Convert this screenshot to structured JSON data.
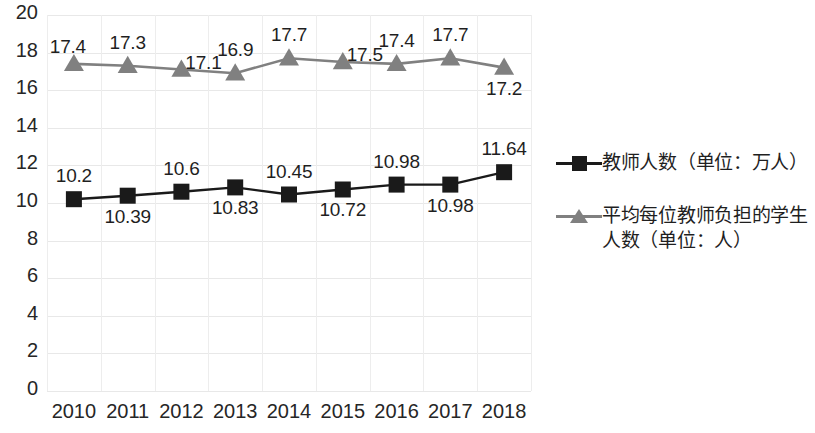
{
  "chart_data": {
    "type": "line",
    "title": "",
    "subtitle": "",
    "xlabel": "",
    "ylabel": "",
    "ylim": [
      0,
      20
    ],
    "y_ticks": [
      "0",
      "2",
      "4",
      "6",
      "8",
      "10",
      "12",
      "14",
      "16",
      "18",
      "20"
    ],
    "grid": true,
    "legend_position": "right",
    "categories": [
      "2010",
      "2011",
      "2012",
      "2013",
      "2014",
      "2015",
      "2016",
      "2017",
      "2018"
    ],
    "series": [
      {
        "name": "教师人数（单位：万人）",
        "marker": "square",
        "color": "#1a1a1a",
        "line_color": "#1a1a1a",
        "values": [
          10.2,
          10.39,
          10.6,
          10.83,
          10.45,
          10.72,
          10.98,
          10.98,
          11.64
        ],
        "labels": [
          "10.2",
          "10.39",
          "10.6",
          "10.83",
          "10.45",
          "10.72",
          "10.98",
          "10.98",
          "11.64"
        ],
        "label_positions": [
          "above",
          "below",
          "above",
          "below",
          "above",
          "below",
          "above",
          "below",
          "above"
        ]
      },
      {
        "name": "平均每位教师负担的学生人数（单位：人）",
        "marker": "triangle",
        "color": "#808080",
        "line_color": "#808080",
        "values": [
          17.4,
          17.3,
          17.1,
          16.9,
          17.7,
          17.5,
          17.4,
          17.7,
          17.2
        ],
        "labels": [
          "17.4",
          "17.3",
          "17.1",
          "16.9",
          "17.7",
          "17.5",
          "17.4",
          "17.7",
          "17.2"
        ],
        "label_positions": [
          "left",
          "above",
          "right",
          "above",
          "above",
          "right",
          "above",
          "above",
          "below"
        ]
      }
    ]
  },
  "legend": {
    "entries": [
      {
        "label": "教师人数（单位：万人）",
        "marker": "square-marker",
        "color": "#1a1a1a"
      },
      {
        "label": "平均每位教师负担的学生人数（单位：人）",
        "marker": "triangle-marker",
        "color": "#808080"
      }
    ]
  },
  "colors": {
    "teacher_series": "#1a1a1a",
    "ratio_series": "#808080",
    "grid": "#e8e8e8",
    "axis": "#d0d0d0",
    "background": "#ffffff",
    "text": "#1f1f1f"
  }
}
